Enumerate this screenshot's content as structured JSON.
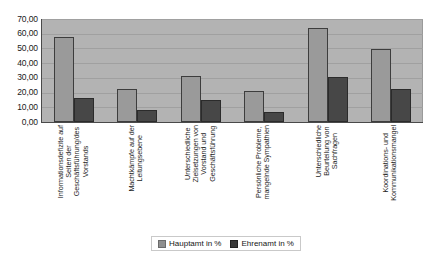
{
  "chart_data": {
    "type": "bar",
    "title": "",
    "xlabel": "",
    "ylabel": "",
    "ylim": [
      0,
      70
    ],
    "ytick_step": 10,
    "grid": true,
    "legend_position": "bottom",
    "decimal_separator": ",",
    "categories": [
      "Informationsdefizite auf\nSeiten der\nGeschäftsführung/des\nVorstands",
      "Machtkämpfe auf der\nLeitungsebene",
      "Unterschiedliche\nZielsetzungen von\nVorstand und\nGeschäftsführung",
      "Persönliche Probleme,\nmangelnde Sympathien",
      "Unterschiedliche\nBeurteilung von\nSachfragen",
      "Koordinations- und\nKommunikationsmangel"
    ],
    "ytick_labels": [
      "70,00",
      "60,00",
      "50,00",
      "40,00",
      "30,00",
      "20,00",
      "10,00",
      "0,00"
    ],
    "series": [
      {
        "name": "Hauptamt in %",
        "color": "#9a9a9a",
        "values": [
          57.8,
          22.5,
          31.3,
          21.0,
          64.0,
          49.5
        ]
      },
      {
        "name": "Ehrenamt in %",
        "color": "#474747",
        "values": [
          16.3,
          8.2,
          15.0,
          6.8,
          30.5,
          22.5
        ]
      }
    ]
  },
  "legend": {
    "items": [
      {
        "label": "Hauptamt in %",
        "swatch_icon": "square-swatch-gray"
      },
      {
        "label": "Ehrenamt in %",
        "swatch_icon": "square-swatch-dark"
      }
    ]
  }
}
